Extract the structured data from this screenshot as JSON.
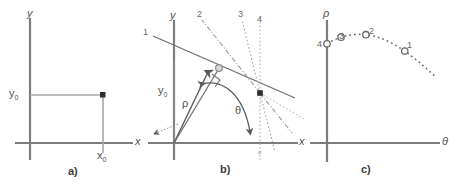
{
  "figure": {
    "background_color": "#ffffff",
    "stroke_color": "#767676",
    "text_color": "#4f4f4f"
  },
  "panel_a": {
    "caption": "a)",
    "x_axis_label": "x",
    "y_axis_label": "y",
    "point_x_label": "x",
    "point_x_sub": "0",
    "point_y_label": "y",
    "point_y_sub": "0",
    "point_marker": "filled-square-dot"
  },
  "panel_b": {
    "caption": "b)",
    "x_axis_label": "x",
    "y_axis_label": "y",
    "rho_label": "ρ",
    "theta_label": "θ",
    "y_intercept_label": "y",
    "y_intercept_sub": "0",
    "origin_label": "o",
    "line_labels": [
      "1",
      "2",
      "3",
      "4"
    ],
    "line_styles": [
      "solid",
      "dash-dot",
      "dotted",
      "dotted"
    ],
    "foot_marker": "open-circle",
    "point_marker": "filled-square-dot",
    "right_angle_marker": true
  },
  "panel_c": {
    "caption": "c)",
    "x_axis_label": "θ",
    "y_axis_label": "ρ",
    "curve_style": "dotted",
    "point_labels": [
      "4",
      "3",
      "2",
      "1"
    ],
    "point_marker": "open-circle"
  },
  "chart_data": {
    "type": "line",
    "xlabel": "θ",
    "ylabel": "ρ",
    "grid": false,
    "legend": null,
    "xlim": [
      0,
      1
    ],
    "ylim": [
      0,
      1
    ],
    "series": [
      {
        "name": "rho(theta) for point (x0,y0)",
        "style": "dotted",
        "x": [
          0.0,
          0.05,
          0.1,
          0.15,
          0.2,
          0.25,
          0.3,
          0.35,
          0.4,
          0.45,
          0.5,
          0.55,
          0.6,
          0.65,
          0.7,
          0.75,
          0.8,
          0.85,
          0.9,
          0.95,
          1.0
        ],
        "y": [
          0.82,
          0.845,
          0.865,
          0.88,
          0.89,
          0.896,
          0.898,
          0.896,
          0.89,
          0.88,
          0.866,
          0.848,
          0.826,
          0.8,
          0.772,
          0.74,
          0.706,
          0.67,
          0.632,
          0.592,
          0.552
        ]
      }
    ],
    "annotations": [
      {
        "label": "4",
        "x": 0.0,
        "y": 0.82,
        "marker": "open-circle"
      },
      {
        "label": "3",
        "x": 0.13,
        "y": 0.875,
        "marker": "open-circle"
      },
      {
        "label": "2",
        "x": 0.36,
        "y": 0.895,
        "marker": "open-circle"
      },
      {
        "label": "1",
        "x": 0.72,
        "y": 0.76,
        "marker": "open-circle"
      }
    ]
  }
}
